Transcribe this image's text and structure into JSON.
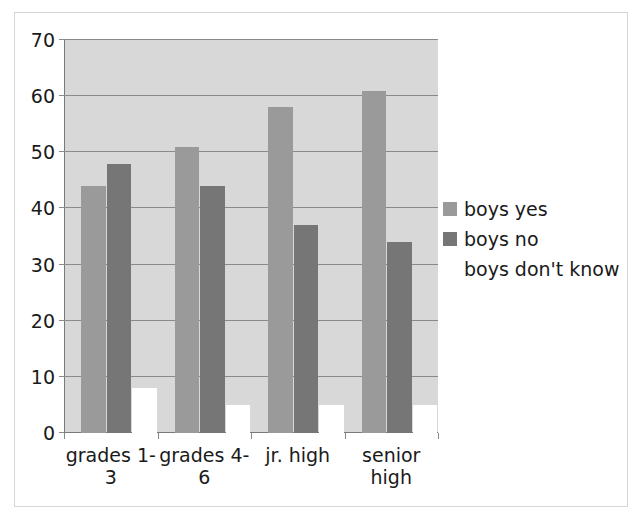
{
  "chart_data": {
    "type": "bar",
    "title": "",
    "subtitle": "",
    "xlabel": "",
    "ylabel": "",
    "categories": [
      "grades 1-3",
      "grades 4-6",
      "jr. high",
      "senior high"
    ],
    "series": [
      {
        "name": "boys yes",
        "values": [
          44,
          51,
          58,
          61
        ],
        "color": "#9a9a9a"
      },
      {
        "name": "boys no",
        "values": [
          48,
          44,
          37,
          34
        ],
        "color": "#767676"
      },
      {
        "name": "boys don't know",
        "values": [
          8,
          5,
          5,
          5
        ],
        "color": "#ffffff"
      }
    ],
    "ylim": [
      0,
      70
    ],
    "yticks": [
      0,
      10,
      20,
      30,
      40,
      50,
      60,
      70
    ],
    "ytick_labels": [
      "0",
      "10",
      "20",
      "30",
      "40",
      "50",
      "60",
      "70"
    ],
    "grid": "horizontal",
    "legend_position": "right",
    "plot_background": "#d8d8d8",
    "gridline_color": "#8a8a8a",
    "axis_color": "#7a7a7a",
    "frame_color": "#d6d6d6"
  },
  "legend": {
    "entries": [
      {
        "label": "boys yes",
        "color": "#9a9a9a",
        "swatch_visible": true
      },
      {
        "label": "boys no",
        "color": "#767676",
        "swatch_visible": true
      },
      {
        "label": "boys don't know",
        "color": "#ffffff",
        "swatch_visible": false
      }
    ]
  }
}
